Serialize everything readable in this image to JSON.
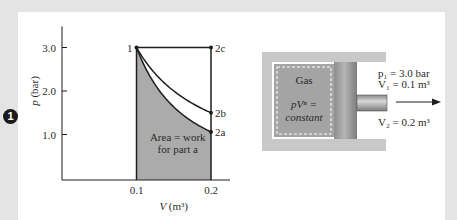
{
  "figure_marker": "1",
  "chart_data": {
    "type": "line",
    "title": "",
    "xlabel": "V (m³)",
    "ylabel": "p (bar)",
    "xlim": [
      0.0,
      0.2
    ],
    "ylim": [
      0.0,
      3.6
    ],
    "x_ticks": [
      {
        "value": 0.1,
        "label": "0.1"
      },
      {
        "value": 0.2,
        "label": "0.2"
      }
    ],
    "y_ticks": [
      {
        "value": 1.0,
        "label": "1.0"
      },
      {
        "value": 2.0,
        "label": "2.0"
      },
      {
        "value": 3.0,
        "label": "3.0"
      }
    ],
    "grid": false,
    "points": [
      {
        "name": "1",
        "V": 0.1,
        "p": 3.0
      },
      {
        "name": "2a",
        "V": 0.2,
        "p": 1.06
      },
      {
        "name": "2b",
        "V": 0.2,
        "p": 1.5
      },
      {
        "name": "2c",
        "V": 0.2,
        "p": 3.0
      }
    ],
    "series": [
      {
        "name": "process 1-2a (shaded, work for part a)",
        "n": 1.5,
        "from": "1",
        "to": "2a",
        "shaded": true
      },
      {
        "name": "process 1-2b",
        "n": 1.0,
        "from": "1",
        "to": "2b",
        "shaded": false
      },
      {
        "name": "process 1-2c",
        "n": 0.0,
        "from": "1",
        "to": "2c",
        "shaded": false
      }
    ],
    "annotation": [
      "Area = work",
      "for part a"
    ],
    "colors": {
      "shade": "#ababab",
      "line": "#1e1e1e"
    }
  },
  "cylinder": {
    "gas_label": "Gas",
    "relation_line1": "pVⁿ =",
    "relation_line2": "constant",
    "p1_label": "p₁ = 3.0 bar",
    "v1_label": "V₁ = 0.1 m³",
    "v2_label": "V₂ = 0.2 m³"
  }
}
